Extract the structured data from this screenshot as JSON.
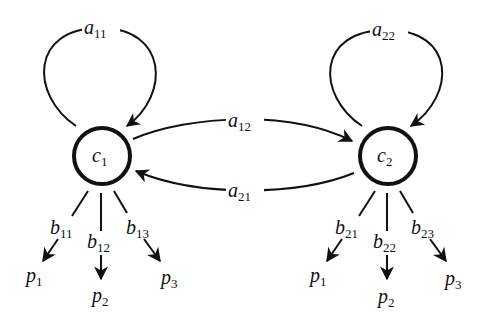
{
  "diagram": {
    "type": "directed-graph",
    "colors": {
      "stroke": "#111111",
      "background": "#ffffff"
    },
    "nodes": [
      {
        "id": "c1",
        "label": "c",
        "sub": "1"
      },
      {
        "id": "c2",
        "label": "c",
        "sub": "2"
      }
    ],
    "edges": {
      "a11": {
        "label": "a",
        "sub": "11",
        "from": "c1",
        "to": "c1"
      },
      "a22": {
        "label": "a",
        "sub": "22",
        "from": "c2",
        "to": "c2"
      },
      "a12": {
        "label": "a",
        "sub": "12",
        "from": "c1",
        "to": "c2"
      },
      "a21": {
        "label": "a",
        "sub": "21",
        "from": "c2",
        "to": "c1"
      }
    },
    "outputs": {
      "c1": [
        {
          "weight": "b",
          "wsub": "11",
          "target": "p",
          "tsub": "1"
        },
        {
          "weight": "b",
          "wsub": "12",
          "target": "p",
          "tsub": "2"
        },
        {
          "weight": "b",
          "wsub": "13",
          "target": "p",
          "tsub": "3"
        }
      ],
      "c2": [
        {
          "weight": "b",
          "wsub": "21",
          "target": "p",
          "tsub": "1"
        },
        {
          "weight": "b",
          "wsub": "22",
          "target": "p",
          "tsub": "2"
        },
        {
          "weight": "b",
          "wsub": "23",
          "target": "p",
          "tsub": "3"
        }
      ]
    }
  }
}
